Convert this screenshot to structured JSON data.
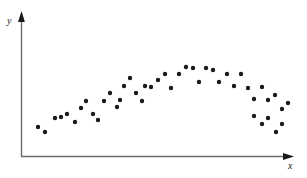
{
  "chart_data": {
    "type": "scatter",
    "title": "",
    "subtitle": "",
    "xlabel": "x",
    "ylabel": "y",
    "grid": false,
    "legend": null,
    "xlim": [
      0,
      100
    ],
    "ylim": [
      0,
      100
    ],
    "axis_ticks": {
      "x": [],
      "y": []
    },
    "axis_style": "arrow-tipped-L-frame",
    "marker": {
      "shape": "circle",
      "color": "#1a1a1a",
      "size_px": 3.2,
      "count": 45
    },
    "relationship": "inverted-U / quadratic (rises, peaks near middle, falls)",
    "points": [
      {
        "x": 6.7,
        "y": 22.9
      },
      {
        "x": 9.3,
        "y": 18.6
      },
      {
        "x": 15.2,
        "y": 33.6
      },
      {
        "x": 20.4,
        "y": 29.3
      },
      {
        "x": 22.6,
        "y": 42.9
      },
      {
        "x": 24.8,
        "y": 50.0
      },
      {
        "x": 27.4,
        "y": 37.1
      },
      {
        "x": 31.5,
        "y": 50.0
      },
      {
        "x": 33.7,
        "y": 58.6
      },
      {
        "x": 36.3,
        "y": 43.6
      },
      {
        "x": 38.9,
        "y": 65.0
      },
      {
        "x": 41.1,
        "y": 72.9
      },
      {
        "x": 43.3,
        "y": 57.1
      },
      {
        "x": 45.6,
        "y": 50.0
      },
      {
        "x": 48.9,
        "y": 64.3
      },
      {
        "x": 51.5,
        "y": 72.1
      },
      {
        "x": 54.1,
        "y": 78.6
      },
      {
        "x": 56.3,
        "y": 63.6
      },
      {
        "x": 59.3,
        "y": 78.6
      },
      {
        "x": 61.9,
        "y": 86.4
      },
      {
        "x": 64.4,
        "y": 85.0
      },
      {
        "x": 66.7,
        "y": 70.0
      },
      {
        "x": 69.3,
        "y": 85.7
      },
      {
        "x": 71.9,
        "y": 83.6
      },
      {
        "x": 74.1,
        "y": 70.7
      },
      {
        "x": 77.0,
        "y": 79.3
      },
      {
        "x": 79.6,
        "y": 65.0
      },
      {
        "x": 82.2,
        "y": 78.6
      },
      {
        "x": 84.8,
        "y": 63.6
      },
      {
        "x": 87.0,
        "y": 52.1
      },
      {
        "x": 90.0,
        "y": 64.3
      },
      {
        "x": 92.2,
        "y": 51.4
      },
      {
        "x": 94.8,
        "y": 55.7
      },
      {
        "x": 97.4,
        "y": 40.7
      },
      {
        "x": 99.6,
        "y": 47.1
      },
      {
        "x": 102.2,
        "y": 36.4
      },
      {
        "x": 104.4,
        "y": 29.3
      },
      {
        "x": 107.0,
        "y": 33.6
      },
      {
        "x": 109.6,
        "y": 25.0
      },
      {
        "x": 111.9,
        "y": 20.7
      },
      {
        "x": 114.4,
        "y": 27.1
      },
      {
        "x": 117.0,
        "y": 14.3
      },
      {
        "x": 119.3,
        "y": 21.4
      },
      {
        "x": 28.5,
        "y": 29.3
      },
      {
        "x": 17.8,
        "y": 25.0
      }
    ],
    "points_px": [
      [
        38,
        127
      ],
      [
        45,
        132
      ],
      [
        61,
        117
      ],
      [
        75,
        122
      ],
      [
        81,
        108
      ],
      [
        86,
        101
      ],
      [
        93,
        114
      ],
      [
        104,
        101
      ],
      [
        110,
        93
      ],
      [
        117,
        107
      ],
      [
        124,
        86
      ],
      [
        130,
        78
      ],
      [
        136,
        93
      ],
      [
        142,
        101
      ],
      [
        151,
        87
      ],
      [
        158,
        80
      ],
      [
        165,
        74
      ],
      [
        171,
        88
      ],
      [
        179,
        74
      ],
      [
        186,
        67
      ],
      [
        193,
        68
      ],
      [
        199,
        82
      ],
      [
        206,
        68
      ],
      [
        213,
        70
      ],
      [
        219,
        82
      ],
      [
        227,
        74
      ],
      [
        234,
        86
      ],
      [
        241,
        74
      ],
      [
        248,
        88
      ],
      [
        254,
        99
      ],
      [
        262,
        87
      ],
      [
        268,
        100
      ],
      [
        275,
        95
      ],
      [
        282,
        109
      ],
      [
        288,
        103
      ],
      [
        67,
        114
      ],
      [
        55,
        118
      ],
      [
        98,
        120
      ],
      [
        120,
        100
      ],
      [
        145,
        86
      ],
      [
        254,
        116
      ],
      [
        262,
        124
      ],
      [
        268,
        118
      ],
      [
        276,
        132
      ],
      [
        282,
        124
      ]
    ]
  },
  "axes": {
    "y_label": "y",
    "x_label": "x",
    "origin_px": [
      21,
      157
    ],
    "y_axis_top_px": [
      21,
      14
    ],
    "x_axis_right_px": [
      292,
      157
    ],
    "line_color": "#5a5a5a",
    "arrow_color": "#1a1a1a"
  }
}
